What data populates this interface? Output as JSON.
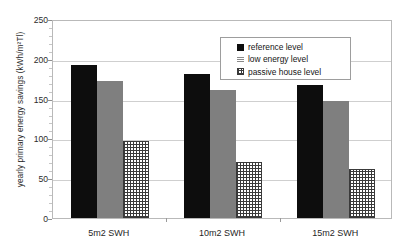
{
  "chart_data": {
    "type": "bar",
    "title": "",
    "subtitle": "",
    "xlabel": "",
    "ylabel": "yearly primary energy savings (kWh/m²Tl)",
    "categories": [
      "5m2 SWH",
      "10m2 SWH",
      "15m2 SWH"
    ],
    "series": [
      {
        "name": "reference level",
        "values": [
          192,
          181,
          167
        ],
        "color": "#0d0d0d"
      },
      {
        "name": "low energy level",
        "values": [
          172,
          161,
          147
        ],
        "color": "#7f7f7f"
      },
      {
        "name": "passive house level",
        "values": [
          97,
          70,
          61
        ],
        "color": "#ffffff"
      }
    ],
    "ylim": [
      0,
      250
    ],
    "yticks": [
      0,
      50,
      100,
      150,
      200,
      250
    ],
    "ytick_labels": [
      "0",
      "50",
      "100",
      "150",
      "200",
      "250"
    ],
    "grid": true,
    "legend_position": "top-center"
  },
  "legend": {
    "entries": [
      {
        "label": "reference level"
      },
      {
        "label": "low energy level"
      },
      {
        "label": "passive house level"
      }
    ]
  },
  "axes": {
    "y_title": "yearly primary energy savings (kWh/m²Tl)"
  }
}
